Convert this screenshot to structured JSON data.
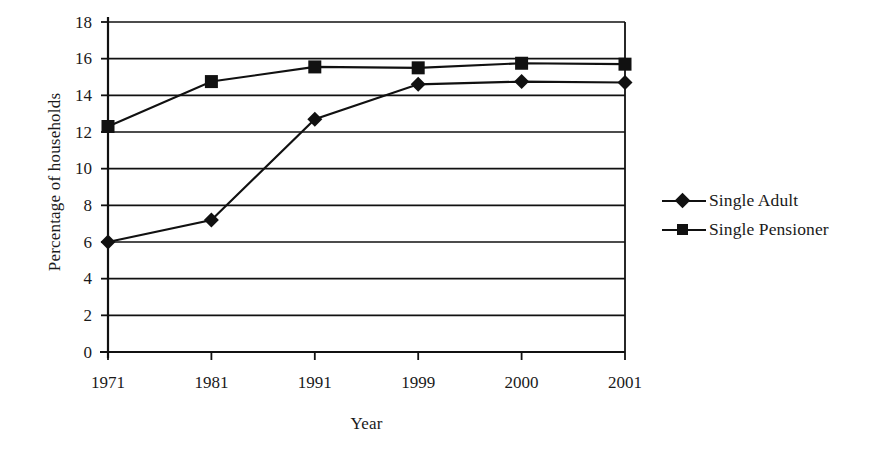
{
  "chart_data": {
    "type": "line",
    "title": "",
    "xlabel": "Year",
    "ylabel": "Percentage of households",
    "categories": [
      "1971",
      "1981",
      "1991",
      "1999",
      "2000",
      "2001"
    ],
    "series": [
      {
        "name": "Single Adult",
        "marker": "diamond",
        "color": "#111111",
        "values": [
          6.0,
          7.2,
          12.7,
          14.6,
          14.75,
          14.7
        ]
      },
      {
        "name": "Single Pensioner",
        "marker": "square",
        "color": "#111111",
        "values": [
          12.3,
          14.75,
          15.55,
          15.5,
          15.75,
          15.7
        ]
      }
    ],
    "ylim": [
      0,
      18
    ],
    "ytick_step": 2,
    "yticks": [
      "0",
      "2",
      "4",
      "6",
      "8",
      "10",
      "12",
      "14",
      "16",
      "18"
    ],
    "grid": "horizontal",
    "legend_position": "right",
    "background_color": "#ffffff",
    "axis_color": "#111111"
  }
}
